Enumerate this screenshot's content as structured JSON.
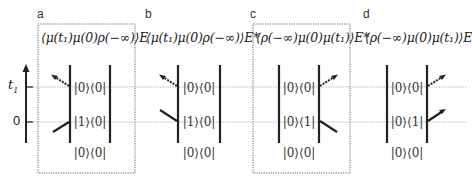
{
  "axis": {
    "t1_label": "t",
    "t1_sub": "1",
    "zero_label": "0"
  },
  "panels": [
    {
      "id": "a",
      "label": "a",
      "formula": "⟨μ(t₁)μ(0)ρ(−∞)⟩E",
      "boxed": true,
      "kets": [
        "|0⟩⟨0|",
        "|1⟩⟨0|",
        "|0⟩⟨0|"
      ],
      "interaction_side": "left"
    },
    {
      "id": "b",
      "label": "b",
      "formula": "⟨μ(t₁)μ(0)ρ(−∞)⟩E*",
      "boxed": false,
      "kets": [
        "|0⟩⟨0|",
        "|1⟩⟨0|",
        "|0⟩⟨0|"
      ],
      "interaction_side": "left"
    },
    {
      "id": "c",
      "label": "c",
      "formula": "⟨ρ(−∞)μ(0)μ(t₁)⟩E*",
      "boxed": true,
      "kets": [
        "|0⟩⟨0|",
        "|0⟩⟨1|",
        "|0⟩⟨0|"
      ],
      "interaction_side": "right"
    },
    {
      "id": "d",
      "label": "d",
      "formula": "⟨ρ(−∞)μ(0)μ(t₁)⟩E",
      "boxed": false,
      "kets": [
        "|0⟩⟨0|",
        "|0⟩⟨1|",
        "|0⟩⟨0|"
      ],
      "interaction_side": "right"
    }
  ],
  "colors": {
    "line": "#222222",
    "dotted_guide": "#999999",
    "box_border": "#555555"
  }
}
